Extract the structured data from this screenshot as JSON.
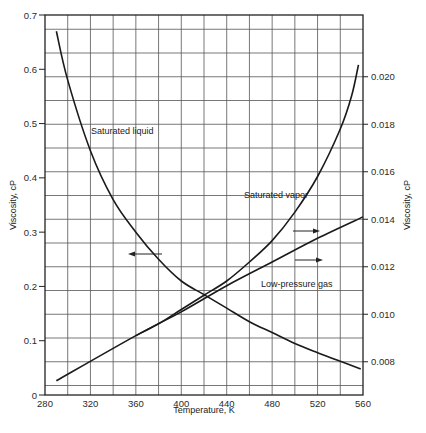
{
  "chart_data": {
    "type": "line",
    "title": "",
    "xlabel": "Temperature, K",
    "ylabel": "Viscosity, cP",
    "ylabel_right": "Viscosity, cP",
    "xlim": [
      280,
      560
    ],
    "ylim": [
      0,
      0.7
    ],
    "ylim_right": [
      0.0066,
      0.0226
    ],
    "grid": true,
    "x_ticks": [
      "280",
      "320",
      "360",
      "400",
      "440",
      "480",
      "520",
      "560"
    ],
    "y_ticks_left": [
      "0",
      "0.1",
      "0.2",
      "0.3",
      "0.4",
      "0.5",
      "0.6",
      "0.7"
    ],
    "y_ticks_right": [
      "0.008",
      "0.010",
      "0.012",
      "0.014",
      "0.016",
      "0.018",
      "0.020"
    ],
    "series": [
      {
        "name": "Saturated liquid",
        "axis": "left",
        "x": [
          290,
          300,
          320,
          340,
          360,
          380,
          400,
          420,
          440,
          460,
          480,
          500,
          520,
          540,
          558
        ],
        "values": [
          0.67,
          0.58,
          0.45,
          0.36,
          0.3,
          0.25,
          0.21,
          0.185,
          0.16,
          0.135,
          0.115,
          0.095,
          0.078,
          0.062,
          0.048
        ]
      },
      {
        "name": "Saturated vapor",
        "axis": "right",
        "x": [
          360,
          380,
          400,
          420,
          440,
          460,
          480,
          500,
          520,
          540,
          550,
          556
        ],
        "values": [
          0.0091,
          0.0096,
          0.0102,
          0.0108,
          0.0114,
          0.0122,
          0.0131,
          0.0143,
          0.0158,
          0.0178,
          0.0192,
          0.0205
        ]
      },
      {
        "name": "Low-pressure gas",
        "axis": "right",
        "x": [
          290,
          360,
          400,
          440,
          480,
          520,
          560
        ],
        "values": [
          0.0072,
          0.0091,
          0.0101,
          0.0112,
          0.0122,
          0.0132,
          0.0141
        ]
      }
    ],
    "annotations": [
      {
        "text": "Saturated liquid",
        "x": 300,
        "y": 0.52
      },
      {
        "text": "Saturated vapor",
        "x": 460,
        "y": 0.0165
      },
      {
        "text": "Low-pressure gas",
        "x": 470,
        "y": 0.0112
      },
      {
        "text": "arrow-left (liquid reads left axis)",
        "x": 360,
        "y": 0.0124
      },
      {
        "text": "arrow-right (vapor reads right axis)",
        "x": 520,
        "y": 0.0141
      },
      {
        "text": "arrow-right (gas reads right axis)",
        "x": 520,
        "y": 0.0129
      }
    ]
  }
}
